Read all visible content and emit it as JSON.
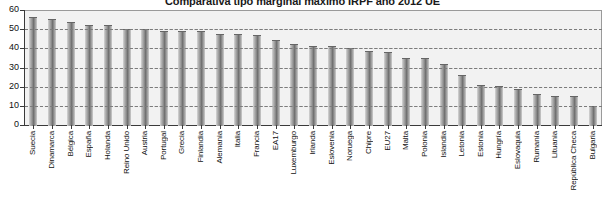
{
  "chart_data": {
    "type": "bar",
    "title": "Comparativa tipo marginal máximo IRPF año 2012 UE",
    "xlabel": "",
    "ylabel": "",
    "ylim": [
      0,
      60
    ],
    "ytick_step": 10,
    "yticks": [
      "0",
      "10",
      "20",
      "30",
      "40",
      "50",
      "60"
    ],
    "grid": true,
    "legend": false,
    "bar_color": "#8e8e8e",
    "plot_background": "#f2f2f2",
    "categories": [
      "Suecia",
      "Dinamarca",
      "Bélgica",
      "España",
      "Holanda",
      "Reino Unido",
      "Austria",
      "Portugal",
      "Grecia",
      "Finlandia",
      "Alemania",
      "Italia",
      "Francia",
      "EA17",
      "Luxemburgo",
      "Irlanda",
      "Eslovenia",
      "Noruega",
      "Chipre",
      "EU27",
      "Malta",
      "Polonia",
      "Islandia",
      "Letonia",
      "Estonia",
      "Hungría",
      "Eslovaquia",
      "Rumanía",
      "Lituania",
      "República Checa",
      "Bulgaria"
    ],
    "values": [
      56.6,
      55.4,
      53.7,
      52.0,
      52.0,
      50.0,
      50.0,
      49.0,
      49.0,
      49.0,
      47.5,
      47.3,
      46.8,
      44.6,
      42.1,
      41.0,
      41.0,
      40.0,
      38.8,
      38.1,
      35.0,
      35.0,
      31.8,
      26.0,
      21.0,
      20.3,
      19.0,
      16.0,
      15.0,
      15.0,
      10.0
    ]
  }
}
